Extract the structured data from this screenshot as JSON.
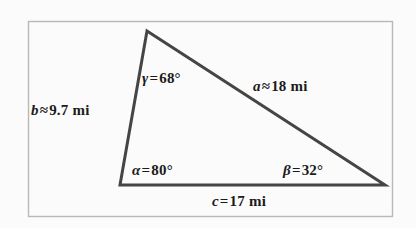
{
  "figure": {
    "type": "geometry-diagram",
    "shape": "triangle",
    "background_color": "#fbfbfb",
    "border_color": "#b8b8b8",
    "stroke_color": "#454545",
    "text_color": "#1b1b1b",
    "frame": {
      "x": 28,
      "y": 21,
      "width": 364,
      "height": 195
    },
    "vertices": {
      "apex": {
        "x": 147,
        "y": 31,
        "angle_label": "gamma"
      },
      "bottom_left": {
        "x": 120,
        "y": 185,
        "angle_label": "alpha"
      },
      "bottom_right": {
        "x": 385,
        "y": 185,
        "angle_label": "beta"
      }
    },
    "labels": {
      "side_b": {
        "var": "b",
        "relation": "≈",
        "value": "9.7 mi"
      },
      "side_a": {
        "var": "a",
        "relation": "≈",
        "value": "18 mi"
      },
      "side_c": {
        "var": "c",
        "relation": "=",
        "value": "17 mi"
      },
      "angle_gamma": {
        "var": "γ",
        "relation": "=",
        "value": "68°"
      },
      "angle_alpha": {
        "var": "α",
        "relation": "=",
        "value": "80°"
      },
      "angle_beta": {
        "var": "β",
        "relation": "=",
        "value": "32°"
      }
    }
  }
}
